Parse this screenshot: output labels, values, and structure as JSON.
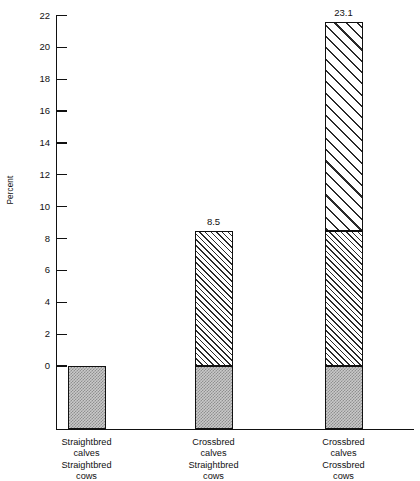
{
  "chart_data": {
    "type": "bar",
    "title": "",
    "subtitle": "",
    "xlabel": "",
    "ylabel": "Percent",
    "ylim": [
      0,
      22
    ],
    "ytick_step": 2,
    "yticks": [
      0,
      2,
      4,
      6,
      8,
      10,
      12,
      14,
      16,
      18,
      20,
      22
    ],
    "ytick_labels": [
      "0",
      "2",
      "4",
      "6",
      "8",
      "10",
      "12",
      "14",
      "16",
      "18",
      "20",
      "22"
    ],
    "grid": false,
    "legend": null,
    "legend_position": "none",
    "note": "Stacked/cumulative bars. Each bar also has a gray stippled base block drawn below the zero line representing the reference animal.",
    "categories": [
      "Straightbred calves Straightbred cows",
      "Crossbred calves Straightbred cows",
      "Crossbred calves Crossbred cows"
    ],
    "category_lines": [
      [
        "Straightbred",
        "calves",
        "Straightbred",
        "cows"
      ],
      [
        "Crossbred",
        "calves",
        "Straightbred",
        "cows"
      ],
      [
        "Crossbred",
        "calves",
        "Crossbred",
        "cows"
      ]
    ],
    "values": [
      0,
      8.5,
      23.1
    ],
    "value_labels": [
      "",
      "8.5",
      "23.1"
    ],
    "series": [
      {
        "name": "Individual heterosis (0 to 8.5)",
        "fill": "fine-diagonal-hatch",
        "values": [
          0,
          8.5,
          8.5
        ]
      },
      {
        "name": "Maternal heterosis (8.5 to top)",
        "fill": "coarse-diagonal-hatch",
        "values": [
          0,
          0,
          13.1
        ]
      },
      {
        "name": "Base block below zero",
        "fill": "gray-stipple",
        "values": [
          -3.9,
          -3.9,
          -3.9
        ]
      }
    ],
    "bars": [
      {
        "label_lines": [
          "Straightbred",
          "calves",
          "Straightbred",
          "cows"
        ],
        "value_label": "",
        "total": 0,
        "segments": [
          {
            "name": "base-block",
            "fill": "gray-stipple",
            "from": -3.9,
            "to": 0
          }
        ]
      },
      {
        "label_lines": [
          "Crossbred",
          "calves",
          "Straightbred",
          "cows"
        ],
        "value_label": "8.5",
        "total": 8.5,
        "segments": [
          {
            "name": "base-block",
            "fill": "gray-stipple",
            "from": -3.9,
            "to": 0
          },
          {
            "name": "individual-heterosis",
            "fill": "fine-diagonal-hatch",
            "from": 0,
            "to": 8.5
          }
        ]
      },
      {
        "label_lines": [
          "Crossbred",
          "calves",
          "Crossbred",
          "cows"
        ],
        "value_label": "23.1",
        "total": 23.1,
        "segments": [
          {
            "name": "base-block",
            "fill": "gray-stipple",
            "from": -3.9,
            "to": 0
          },
          {
            "name": "individual-heterosis",
            "fill": "fine-diagonal-hatch",
            "from": 0,
            "to": 8.5
          },
          {
            "name": "maternal-heterosis",
            "fill": "coarse-diagonal-hatch",
            "from": 8.5,
            "to": 21.6
          }
        ]
      }
    ],
    "colors": {
      "axis": "#111111",
      "text": "#111111",
      "stipple_fill": "#c9c9c9",
      "stipple_dot": "#8f8f8f",
      "hatch_line": "#2a2a2a",
      "hatch_bg": "#ffffff",
      "background": "#ffffff"
    }
  }
}
